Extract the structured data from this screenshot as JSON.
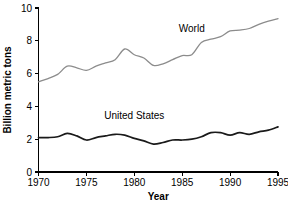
{
  "chart_data": {
    "type": "line",
    "title": "",
    "xlabel": "Year",
    "ylabel": "Billion metric tons",
    "xlim": [
      1970,
      1995
    ],
    "ylim": [
      0,
      10
    ],
    "grid": false,
    "legend_position": "inline-annotation",
    "xticks": [
      "1970",
      "1975",
      "1980",
      "1985",
      "1990",
      "1995"
    ],
    "xtick_values": [
      1970,
      1975,
      1980,
      1985,
      1990,
      1995
    ],
    "yticks": [
      "0",
      "2",
      "4",
      "6",
      "8",
      "10"
    ],
    "ytick_values": [
      0,
      2,
      4,
      6,
      8,
      10
    ],
    "x": [
      1970,
      1971,
      1972,
      1973,
      1974,
      1975,
      1976,
      1977,
      1978,
      1979,
      1980,
      1981,
      1982,
      1983,
      1984,
      1985,
      1986,
      1987,
      1988,
      1989,
      1990,
      1991,
      1992,
      1993,
      1994,
      1995
    ],
    "series": [
      {
        "name": "World",
        "color": "#8c8c8c",
        "label_x": 1986.0,
        "label_y": 8.55,
        "values": [
          5.5,
          5.7,
          5.95,
          6.45,
          6.35,
          6.2,
          6.45,
          6.65,
          6.85,
          7.5,
          7.15,
          6.95,
          6.5,
          6.6,
          6.85,
          7.1,
          7.15,
          7.9,
          8.1,
          8.25,
          8.6,
          8.65,
          8.75,
          9.0,
          9.2,
          9.35
        ]
      },
      {
        "name": "United States",
        "color": "#1a1a1a",
        "label_x": 1980.0,
        "label_y": 3.25,
        "values": [
          2.1,
          2.1,
          2.15,
          2.35,
          2.2,
          1.95,
          2.1,
          2.2,
          2.3,
          2.25,
          2.05,
          1.9,
          1.7,
          1.8,
          1.95,
          1.95,
          2.0,
          2.15,
          2.4,
          2.4,
          2.25,
          2.4,
          2.3,
          2.45,
          2.55,
          2.75
        ]
      }
    ]
  }
}
